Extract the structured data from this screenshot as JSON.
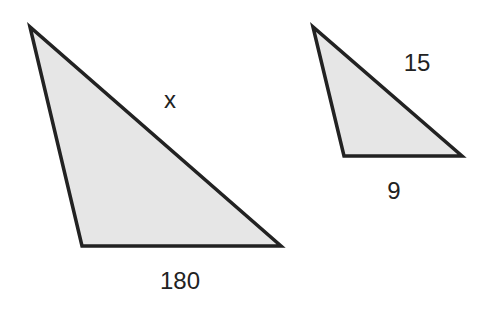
{
  "diagram": {
    "type": "similar-triangles",
    "colors": {
      "fill": "#e6e6e6",
      "stroke": "#222222",
      "text": "#222222"
    },
    "triangles": [
      {
        "id": "large",
        "points": [
          [
            30,
            27
          ],
          [
            82,
            246
          ],
          [
            281,
            246
          ]
        ],
        "labels": {
          "hypotenuse": "x",
          "base": "180"
        }
      },
      {
        "id": "small",
        "points": [
          [
            313,
            27
          ],
          [
            344,
            156
          ],
          [
            462,
            156
          ]
        ],
        "labels": {
          "hypotenuse": "15",
          "base": "9"
        }
      }
    ]
  }
}
